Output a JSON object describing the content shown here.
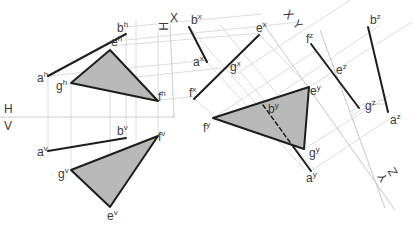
{
  "diagram": {
    "type": "descriptive-geometry-auxiliary-views",
    "colors": {
      "edge": "#1e1e1e",
      "face": "#b9b9b9",
      "construction": "#d8d8d8",
      "text": "#3a3a3a"
    },
    "axes": {
      "hv": {
        "upper": "H",
        "lower": "V"
      },
      "hx": {
        "left": "H",
        "right": "X"
      },
      "xy": {
        "left": "X",
        "right": "Y"
      },
      "yz": {
        "left": "Y",
        "right": "Z"
      }
    },
    "views": {
      "h": {
        "line": {
          "a": "a",
          "b": "b",
          "sup": "h"
        },
        "triangle": {
          "e": "e",
          "f": "f",
          "g": "g",
          "sup": "h"
        }
      },
      "v": {
        "line": {
          "a": "a",
          "b": "b",
          "sup": "v"
        },
        "triangle": {
          "e": "e",
          "f": "f",
          "g": "g",
          "sup": "v"
        }
      },
      "x": {
        "line": {
          "a": "a",
          "b": "b",
          "sup": "x"
        },
        "edge_view": {
          "e": "e",
          "f": "f",
          "g": "g",
          "sup": "x"
        }
      },
      "y": {
        "line": {
          "a": "a",
          "b": "b",
          "sup": "y"
        },
        "triangle": {
          "e": "e",
          "f": "f",
          "g": "g",
          "sup": "y"
        }
      },
      "z": {
        "line": {
          "a": "a",
          "b": "b",
          "sup": "z"
        },
        "edge_view": {
          "e": "e",
          "f": "f",
          "g": "g",
          "sup": "z"
        }
      }
    }
  }
}
